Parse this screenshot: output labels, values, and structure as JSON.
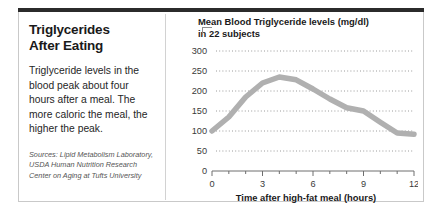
{
  "headline": {
    "line1": "Triglycerides",
    "line2": "After Eating"
  },
  "deck": "Triglyceride levels in the blood peak about four hours after a meal. The more caloric the meal, the higher the peak.",
  "sources": "Sources: Lipid Metabolism Laboratory, USDA Human Nutrition Research Center on Aging at Tufts University",
  "chart_data": {
    "type": "line",
    "title": "Mean Blood Triglyceride levels (mg/dl) in 22 subjects",
    "title_line1": "Mean Blood Triglyceride levels (mg/dl)",
    "title_line2": "in 22 subjects",
    "xlabel": "Time after high-fat meal (hours)",
    "ylabel": "",
    "xlim": [
      0,
      12
    ],
    "ylim": [
      0,
      300
    ],
    "yticks": [
      300,
      250,
      200,
      150,
      100,
      50,
      0
    ],
    "xticks": [
      0,
      3,
      6,
      9,
      12
    ],
    "x_minor_ticks": [
      1,
      2,
      4,
      5,
      7,
      8,
      10,
      11
    ],
    "grid": "horizontal-dotted",
    "legend": "none",
    "line_color": "#b0b0b0",
    "x": [
      0,
      1,
      2,
      3,
      4,
      5,
      6,
      7,
      8,
      9,
      10,
      11,
      12
    ],
    "values": [
      100,
      135,
      185,
      220,
      235,
      228,
      205,
      180,
      158,
      150,
      122,
      95,
      92
    ],
    "series": [
      {
        "name": "Mean blood triglyceride level",
        "values": [
          100,
          135,
          185,
          220,
          235,
          228,
          205,
          180,
          158,
          150,
          122,
          95,
          92
        ]
      }
    ]
  },
  "colors": {
    "rule": "#2b2b2b",
    "border": "#c9c9c9",
    "line": "#b0b0b0",
    "text": "#1a1a1a",
    "grid": "#9a9a9a"
  }
}
